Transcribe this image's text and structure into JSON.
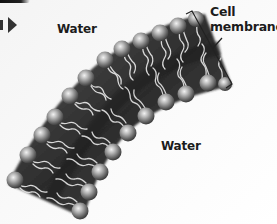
{
  "figure": {
    "labels": {
      "water_top": "Water",
      "water_bottom": "Water",
      "cell_membrane_line1": "Cell",
      "cell_membrane_line2": "membrane"
    },
    "icons": {
      "nav_arrow": "right-triangle-arrow"
    },
    "colors": {
      "background": "#f6f6f6",
      "membrane_body": "#4a4a4a",
      "membrane_core": "#2a2a2a",
      "head_light": "#e6e6e6",
      "head_dark": "#5a5a5a",
      "tail": "#d8d8d8",
      "text": "#1c1c1c",
      "bracket": "#222222"
    },
    "outer_heads": [
      [
        15,
        180
      ],
      [
        28,
        155
      ],
      [
        42,
        135
      ],
      [
        55,
        117
      ],
      [
        70,
        96
      ],
      [
        86,
        78
      ],
      [
        105,
        60
      ],
      [
        122,
        47
      ],
      [
        141,
        40
      ],
      [
        160,
        32
      ],
      [
        178,
        25
      ],
      [
        196,
        18
      ],
      [
        210,
        24
      ]
    ],
    "inner_heads": [
      [
        80,
        211
      ],
      [
        89,
        192
      ],
      [
        100,
        172
      ],
      [
        113,
        152
      ],
      [
        128,
        132
      ],
      [
        146,
        116
      ],
      [
        166,
        101
      ],
      [
        186,
        94
      ],
      [
        208,
        81
      ],
      [
        224,
        86
      ]
    ]
  }
}
